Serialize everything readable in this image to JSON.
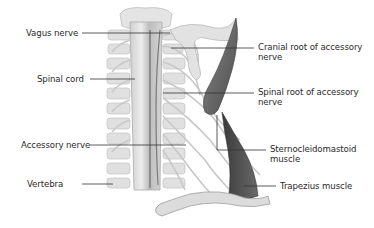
{
  "diagram": {
    "labels_left": [
      {
        "id": "vagus",
        "text": "Vagus nerve"
      },
      {
        "id": "spinal_cord",
        "text": "Spinal cord"
      },
      {
        "id": "accessory",
        "text": "Accessory nerve"
      },
      {
        "id": "vertebra",
        "text": "Vertebra"
      }
    ],
    "labels_right": [
      {
        "id": "cranial_root",
        "line1": "Cranial root of accessory",
        "line2": "nerve"
      },
      {
        "id": "spinal_root",
        "line1": "Spinal root of accessory",
        "line2": "nerve"
      },
      {
        "id": "scm",
        "line1": "Sternocleidomastoid",
        "line2": "muscle"
      },
      {
        "id": "trapezius",
        "line1": "Trapezius muscle"
      }
    ],
    "colors": {
      "bone": "#d9d9d9",
      "bone_shade": "#b5b5b5",
      "muscle": "#6e6e6e",
      "muscle_dark": "#3f3f3f",
      "leader_line": "#333333",
      "text": "#2a2a2a"
    }
  }
}
